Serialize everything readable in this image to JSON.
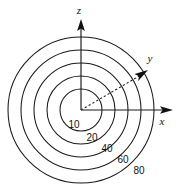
{
  "figure": {
    "type": "polar-contour-diagram",
    "background_color": "#ffffff",
    "stroke_color": "#1a1a1a",
    "origin": {
      "x": 81,
      "y": 110
    },
    "axes": [
      {
        "name": "z",
        "label": "z",
        "direction": "up",
        "label_x": 79,
        "label_y": 14,
        "tip_x": 81,
        "tip_y": 19
      },
      {
        "name": "y",
        "label": "y",
        "direction": "upper-right",
        "label_x": 150,
        "label_y": 62,
        "tip_x": 148,
        "tip_y": 70
      },
      {
        "name": "x",
        "label": "x",
        "direction": "right",
        "label_x": 162,
        "label_y": 125,
        "tip_x": 173,
        "tip_y": 110
      }
    ],
    "dashed_ray": {
      "name": "y-axis-dashed-ray",
      "from_x": 81,
      "from_y": 110,
      "to_x": 141,
      "to_y": 75
    },
    "contours": [
      {
        "label": "10",
        "radius": 21,
        "label_x": 74,
        "label_y": 128
      },
      {
        "label": "20",
        "radius": 34,
        "label_x": 92,
        "label_y": 141
      },
      {
        "label": "40",
        "radius": 47,
        "label_x": 107,
        "label_y": 152
      },
      {
        "label": "60",
        "radius": 60,
        "label_x": 123,
        "label_y": 163
      },
      {
        "label": "80",
        "radius": 73,
        "label_x": 139,
        "label_y": 174
      }
    ],
    "contour_labels": [
      "10",
      "20",
      "40",
      "60",
      "80"
    ],
    "axis_labels": [
      "z",
      "y",
      "x"
    ]
  }
}
